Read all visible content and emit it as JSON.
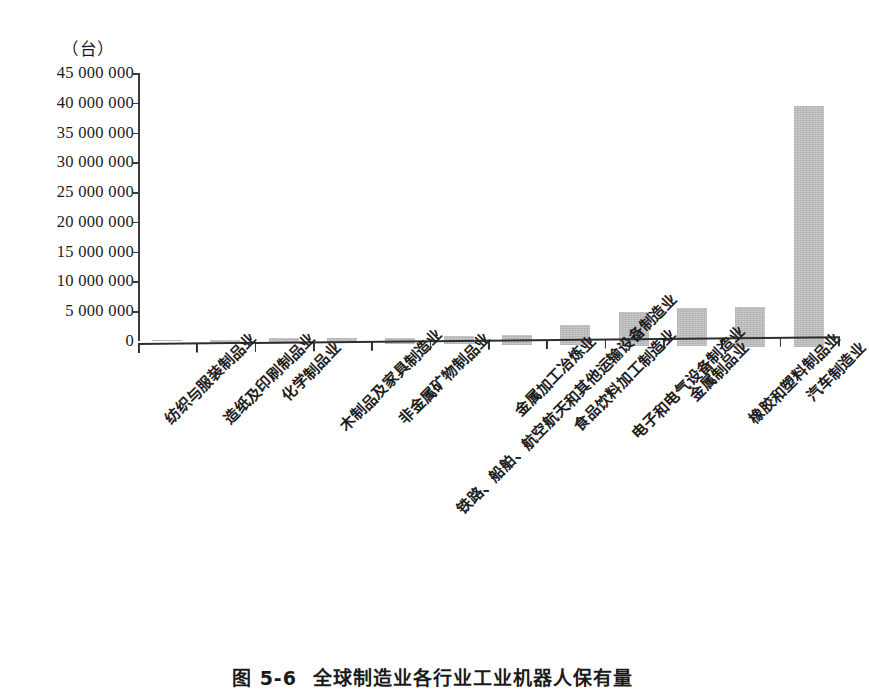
{
  "chart_data": {
    "type": "bar",
    "title": "",
    "caption_number": "图 5-6",
    "caption_text": "全球制造业各行业工业机器人保有量",
    "xlabel": "",
    "ylabel": "",
    "yunit": "（台）",
    "ylim": [
      0,
      45000000
    ],
    "ytick_step": 5000000,
    "grid": false,
    "legend": "none",
    "bar_color": "#c9c9c9",
    "axis_color": "#2e2e2e",
    "ytick_labels": [
      "45 000 000",
      "40 000 000",
      "35 000 000",
      "30 000 000",
      "25 000 000",
      "20 000 000",
      "15 000 000",
      "10 000 000",
      "5 000 000",
      "0"
    ],
    "ytick_values": [
      45000000,
      40000000,
      35000000,
      30000000,
      25000000,
      20000000,
      15000000,
      10000000,
      5000000,
      0
    ],
    "categories": [
      "纺织与服装制品业",
      "造纸及印刷制品业",
      "化学制品业",
      "木制品及家具制造业",
      "非金属矿物制品业",
      "铁路、船舶、航空航天和其他运输设备制造业",
      "金属加工冶炼业",
      "食品饮料加工制造业",
      "电子和电气设备制造业",
      "金属制品业",
      "橡胶和塑料制品业",
      "汽车制造业"
    ],
    "values": [
      100000,
      300000,
      700000,
      800000,
      900000,
      1300000,
      1600000,
      3400000,
      5600000,
      6500000,
      6700000,
      40600000
    ]
  }
}
